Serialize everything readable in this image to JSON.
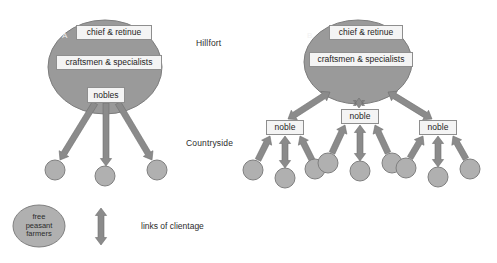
{
  "figure": {
    "type": "diagram",
    "background_color": "#ffffff"
  },
  "colors": {
    "ellipse_fill": "#9a9a9a",
    "ellipse_stroke": "#7d7d7d",
    "box_fill": "#f4f4f4",
    "box_stroke": "#8e8e8e",
    "circle_fill": "#b0b0b0",
    "circle_stroke": "#7f7f7f",
    "arrow_fill": "#8b8b8b",
    "arrow_stroke": "#6f6f6f",
    "text": "#2b2b2b",
    "panel_letter": "#f2f2f2"
  },
  "region_labels": [
    {
      "name": "hillfort",
      "text": "Hillfort",
      "x": 196,
      "y": 38
    },
    {
      "name": "countryside",
      "text": "Countryside",
      "x": 186,
      "y": 138
    }
  ],
  "panels": [
    {
      "id": "A",
      "letter": "A",
      "letter_x": 62,
      "letter_y": 31,
      "ellipse": {
        "cx": 105,
        "cy": 67,
        "rx": 57,
        "ry": 47
      },
      "boxes": [
        {
          "name": "chief-retinue",
          "label": "chief & retinue",
          "x": 76,
          "y": 25,
          "w": 76,
          "h": 15
        },
        {
          "name": "craftsmen-specialists",
          "label": "craftsmen & specialists",
          "x": 56,
          "y": 55,
          "w": 106,
          "h": 15
        },
        {
          "name": "nobles",
          "label": "nobles",
          "x": 87,
          "y": 87,
          "w": 38,
          "h": 16
        }
      ],
      "circles": [
        {
          "name": "peasant-circle-left",
          "cx": 55,
          "cy": 170,
          "r": 10
        },
        {
          "name": "peasant-circle-centre",
          "cx": 105,
          "cy": 176,
          "r": 10
        },
        {
          "name": "peasant-circle-right",
          "cx": 157,
          "cy": 170,
          "r": 10
        }
      ],
      "links": [
        {
          "name": "link-nobles-to-left-peasant",
          "from": [
            95,
            103
          ],
          "to": [
            60,
            160
          ],
          "heads": "end"
        },
        {
          "name": "link-nobles-to-centre-peasant",
          "from": [
            106,
            103
          ],
          "to": [
            106,
            166
          ],
          "heads": "end"
        },
        {
          "name": "link-nobles-to-right-peasant",
          "from": [
            118,
            103
          ],
          "to": [
            152,
            160
          ],
          "heads": "end"
        }
      ]
    },
    {
      "id": "B",
      "letter": "B",
      "letter_x": 307,
      "letter_y": 31,
      "ellipse": {
        "cx": 358,
        "cy": 62,
        "rx": 54,
        "ry": 42
      },
      "boxes": [
        {
          "name": "chief-retinue",
          "label": "chief & retinue",
          "x": 329,
          "y": 25,
          "w": 74,
          "h": 15
        },
        {
          "name": "craftsmen-specialists",
          "label": "craftsmen & specialists",
          "x": 309,
          "y": 52,
          "w": 104,
          "h": 15
        },
        {
          "name": "noble-left",
          "label": "noble",
          "x": 266,
          "y": 120,
          "w": 38,
          "h": 15
        },
        {
          "name": "noble-centre",
          "label": "noble",
          "x": 341,
          "y": 109,
          "w": 38,
          "h": 15
        },
        {
          "name": "noble-right",
          "label": "noble",
          "x": 419,
          "y": 120,
          "w": 38,
          "h": 15
        }
      ],
      "circles": [
        {
          "name": "peasant-circle-l1",
          "cx": 253,
          "cy": 170,
          "r": 10
        },
        {
          "name": "peasant-circle-l2",
          "cx": 285,
          "cy": 178,
          "r": 10
        },
        {
          "name": "peasant-circle-l3",
          "cx": 315,
          "cy": 169,
          "r": 10
        },
        {
          "name": "peasant-circle-c1",
          "cx": 328,
          "cy": 163,
          "r": 10
        },
        {
          "name": "peasant-circle-c2",
          "cx": 360,
          "cy": 171,
          "r": 10
        },
        {
          "name": "peasant-circle-c3",
          "cx": 392,
          "cy": 163,
          "r": 10
        },
        {
          "name": "peasant-circle-r1",
          "cx": 406,
          "cy": 168,
          "r": 10
        },
        {
          "name": "peasant-circle-r2",
          "cx": 438,
          "cy": 177,
          "r": 10
        },
        {
          "name": "peasant-circle-r3",
          "cx": 470,
          "cy": 169,
          "r": 10
        }
      ],
      "links": [
        {
          "name": "link-hillfort-noble-left",
          "from": [
            330,
            92
          ],
          "to": [
            288,
            119
          ],
          "heads": "both"
        },
        {
          "name": "link-hillfort-noble-centre",
          "from": [
            359,
            98
          ],
          "to": [
            359,
            108
          ],
          "heads": "both"
        },
        {
          "name": "link-hillfort-noble-right",
          "from": [
            388,
            92
          ],
          "to": [
            432,
            119
          ],
          "heads": "both"
        },
        {
          "name": "link-noble-left-p1",
          "from": [
            270,
            136
          ],
          "to": [
            258,
            160
          ],
          "heads": "start"
        },
        {
          "name": "link-noble-left-p2",
          "from": [
            285,
            136
          ],
          "to": [
            285,
            168
          ],
          "heads": "both"
        },
        {
          "name": "link-noble-left-p3",
          "from": [
            300,
            136
          ],
          "to": [
            312,
            160
          ],
          "heads": "start"
        },
        {
          "name": "link-noble-centre-p1",
          "from": [
            345,
            125
          ],
          "to": [
            332,
            153
          ],
          "heads": "start"
        },
        {
          "name": "link-noble-centre-p2",
          "from": [
            360,
            125
          ],
          "to": [
            360,
            161
          ],
          "heads": "both"
        },
        {
          "name": "link-noble-centre-p3",
          "from": [
            375,
            125
          ],
          "to": [
            388,
            153
          ],
          "heads": "start"
        },
        {
          "name": "link-noble-right-p1",
          "from": [
            423,
            136
          ],
          "to": [
            410,
            158
          ],
          "heads": "start"
        },
        {
          "name": "link-noble-right-p2",
          "from": [
            438,
            136
          ],
          "to": [
            438,
            167
          ],
          "heads": "both"
        },
        {
          "name": "link-noble-right-p3",
          "from": [
            453,
            136
          ],
          "to": [
            466,
            159
          ],
          "heads": "start"
        }
      ]
    }
  ],
  "legend": {
    "peasant_key": {
      "name": "free-peasant-farmers-key",
      "lines": [
        "free",
        "peasant",
        "farmers"
      ],
      "ellipse": {
        "cx": 39,
        "cy": 226,
        "rx": 26,
        "ry": 21
      }
    },
    "clientage_key": {
      "name": "links-of-clientage-key",
      "label": "links of clientage",
      "label_x": 141,
      "label_y": 226,
      "arrow": {
        "x": 101,
        "y_top": 208,
        "y_bottom": 245
      }
    }
  }
}
